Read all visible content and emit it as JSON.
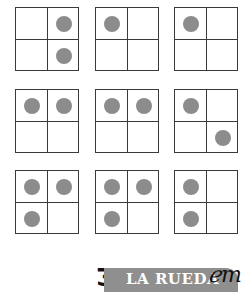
{
  "worksheet": {
    "grids": [
      {
        "row": 1,
        "col": 1,
        "dots": [
          "top-right",
          "bottom-right"
        ]
      },
      {
        "row": 1,
        "col": 2,
        "dots": [
          "top-left"
        ]
      },
      {
        "row": 1,
        "col": 3,
        "dots": [
          "top-left"
        ]
      },
      {
        "row": 2,
        "col": 1,
        "dots": [
          "top-left",
          "top-right"
        ]
      },
      {
        "row": 2,
        "col": 2,
        "dots": [
          "top-left",
          "top-right"
        ]
      },
      {
        "row": 2,
        "col": 3,
        "dots": [
          "top-left",
          "bottom-right"
        ]
      },
      {
        "row": 3,
        "col": 1,
        "dots": [
          "top-left",
          "top-right",
          "bottom-left"
        ]
      },
      {
        "row": 3,
        "col": 2,
        "dots": [
          "top-left",
          "top-right",
          "bottom-left"
        ]
      },
      {
        "row": 3,
        "col": 3,
        "dots": [
          "top-left",
          "bottom-left"
        ]
      }
    ],
    "colors": {
      "dot": "#8c8c8c",
      "grid_line": "#3a3a3a",
      "banner": "#8f8f8f",
      "banner_text": "#ffffff"
    }
  },
  "footer": {
    "brand_text": "LA RUEDA",
    "left_glyph": "Ʒ",
    "right_glyph": "ℯm"
  }
}
